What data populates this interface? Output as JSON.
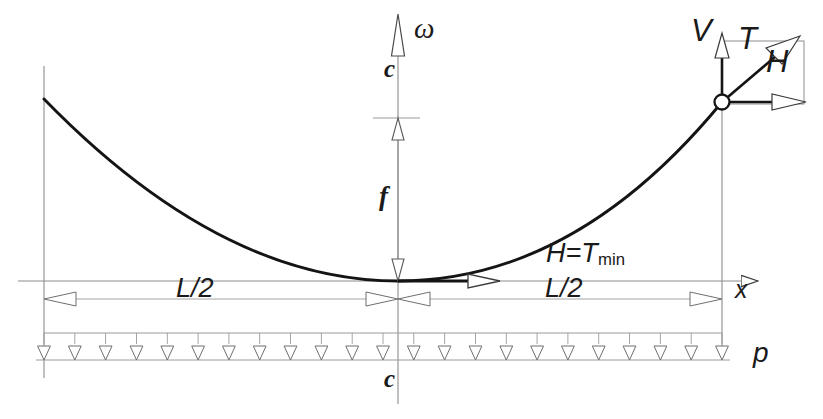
{
  "figure": {
    "type": "engineering-diagram",
    "labels": {
      "omega": "ω",
      "c_top": "c",
      "c_bottom": "c",
      "sag": "f",
      "horizontal_force": "H=T",
      "horizontal_force_sub": "min",
      "x_axis": "x",
      "load": "p",
      "half_span_left": "L/2",
      "half_span_right": "L/2",
      "vertical_reaction": "V",
      "tension": "T",
      "horizontal_reaction": "H"
    },
    "colors": {
      "cable": "#141414",
      "thin_line": "#8c8c8c",
      "dim_line": "#9a9a9a",
      "text": "#1a1a1a",
      "background": "#ffffff"
    },
    "geometry": {
      "origin_x": 398,
      "origin_y": 281,
      "left_support_x": 44,
      "left_support_y": 99,
      "right_support_x": 722,
      "right_support_y": 102,
      "axis_top_y": 14,
      "axis_bottom_y": 404,
      "x_axis_right_x": 776,
      "x_axis_left_x": 18,
      "sag_top_y": 118,
      "sag_bottom_y": 281,
      "dim_line_y": 299,
      "load_top_y": 333,
      "load_base_y": 360,
      "load_arrow_count": 23,
      "hmin_vector_end_x": 500
    },
    "chart_data": {
      "type": "line",
      "title": "",
      "xlabel": "x",
      "ylabel": "ω",
      "curve": "parabola y = 4f x^2 / L^2",
      "notes": [
        "Cable sags by f at midspan",
        "Minimum tension at vertex equals horizontal thrust H",
        "Uniform load p applied over full span L"
      ]
    }
  }
}
